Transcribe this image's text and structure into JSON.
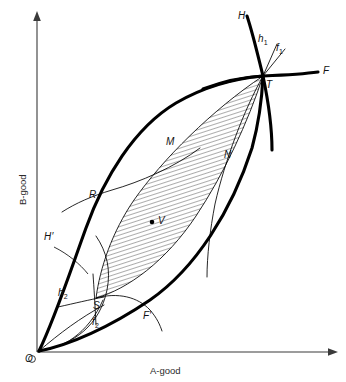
{
  "figure": {
    "background_color": "#ffffff",
    "line_color": "#000000",
    "axis_color": "#3a3a3a"
  },
  "axes": {
    "x_title": "A-good",
    "y_title": "B-good",
    "origin_label": "O"
  },
  "points": [
    {
      "key": "T",
      "label": "T",
      "x": 263,
      "y": 76
    },
    {
      "key": "R",
      "label": "R",
      "x": 96,
      "y": 196
    },
    {
      "key": "S",
      "label": "S",
      "x": 96,
      "y": 298
    },
    {
      "key": "V",
      "label": "V",
      "x": 155,
      "y": 221
    }
  ],
  "curve_labels": [
    {
      "key": "H",
      "label": "H",
      "sub": ""
    },
    {
      "key": "h1",
      "label": "h",
      "sub": "1"
    },
    {
      "key": "f1",
      "label": "f",
      "sub": "1"
    },
    {
      "key": "F",
      "label": "F",
      "sub": ""
    },
    {
      "key": "M",
      "label": "M",
      "sub": ""
    },
    {
      "key": "N",
      "label": "N",
      "sub": ""
    },
    {
      "key": "Hp",
      "label": "H′",
      "sub": ""
    },
    {
      "key": "h2",
      "label": "h",
      "sub": "2"
    },
    {
      "key": "f2",
      "label": "f",
      "sub": "2"
    },
    {
      "key": "Fp",
      "label": "F′",
      "sub": ""
    }
  ],
  "labels": {
    "H": "H",
    "h1_base": "h",
    "h1_sub": "1",
    "f1_base": "f",
    "f1_sub": "1",
    "F": "F",
    "T": "T",
    "M": "M",
    "N": "N",
    "R": "R",
    "V": "V",
    "H_prime": "H′",
    "h2_base": "h",
    "h2_sub": "2",
    "S": "S",
    "f2_base": "f",
    "f2_sub": "2",
    "F_prime": "F′",
    "O": "O",
    "x_axis": "A-good",
    "y_axis": "B-good"
  }
}
